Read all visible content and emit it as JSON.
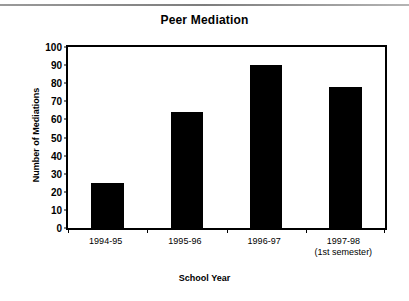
{
  "chart_data": {
    "type": "bar",
    "title": "Peer Mediation",
    "xlabel": "School Year",
    "ylabel": "Number of Mediations",
    "categories": [
      "1994-95",
      "1995-96",
      "1996-97",
      "1997-98"
    ],
    "category_sublabels": [
      "",
      "",
      "",
      "(1st semester)"
    ],
    "values": [
      25,
      64,
      90,
      78
    ],
    "ylim": [
      0,
      100
    ],
    "yticks": [
      0,
      10,
      20,
      30,
      40,
      50,
      60,
      70,
      80,
      90,
      100
    ],
    "ytick_labels": [
      "0",
      "10",
      "20",
      "30",
      "40",
      "50",
      "60",
      "70",
      "80",
      "90",
      "100"
    ],
    "grid": false,
    "legend": "none",
    "bar_color": "#000000",
    "frame_color": "#000000",
    "background_color": "#ffffff"
  }
}
